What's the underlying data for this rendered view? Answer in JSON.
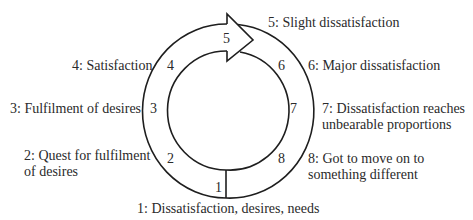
{
  "diagram": {
    "type": "cycle",
    "stages": [
      {
        "number": "1",
        "label_lines": [
          "1: Dissatisfaction, desires, needs"
        ]
      },
      {
        "number": "2",
        "label_lines": [
          "2: Quest for fulfilment",
          "of desires"
        ]
      },
      {
        "number": "3",
        "label_lines": [
          "3: Fulfilment of desires"
        ]
      },
      {
        "number": "4",
        "label_lines": [
          "4: Satisfaction"
        ]
      },
      {
        "number": "5",
        "label_lines": [
          "5: Slight dissatisfaction"
        ]
      },
      {
        "number": "6",
        "label_lines": [
          "6: Major dissatisfaction"
        ]
      },
      {
        "number": "7",
        "label_lines": [
          "7: Dissatisfaction reaches",
          "unbearable proportions"
        ]
      },
      {
        "number": "8",
        "label_lines": [
          "8: Got to move on to",
          "something different"
        ]
      }
    ],
    "colors": {
      "stroke": "#1e1e1e",
      "text": "#2a2a2a",
      "background": "#ffffff"
    }
  }
}
